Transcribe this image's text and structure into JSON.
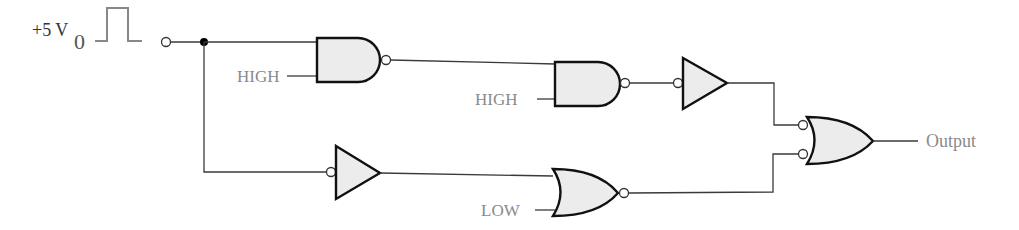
{
  "diagram": {
    "type": "logic-circuit",
    "source": {
      "voltage_label": "+5 V",
      "subscript": "0",
      "signal": "pulse"
    },
    "gates": [
      {
        "id": "nand1",
        "type": "NAND",
        "inputs": [
          "source",
          "HIGH"
        ],
        "output_inverted": true
      },
      {
        "id": "nand2",
        "type": "NAND",
        "inputs": [
          "nand1",
          "HIGH"
        ],
        "output_inverted": true
      },
      {
        "id": "inv_top",
        "type": "inverter (negative-input buffer)",
        "inputs": [
          "nand2"
        ]
      },
      {
        "id": "inv_bottom",
        "type": "inverter (negative-input buffer)",
        "inputs": [
          "source"
        ]
      },
      {
        "id": "nor1",
        "type": "NOR",
        "inputs": [
          "inv_bottom",
          "LOW"
        ],
        "output_inverted": true
      },
      {
        "id": "or_out",
        "type": "OR with inverted inputs (NAND equivalent)",
        "inputs": [
          "inv_top",
          "nor1"
        ]
      }
    ],
    "labels": {
      "high1": "HIGH",
      "high2": "HIGH",
      "low": "LOW",
      "output": "Output"
    }
  }
}
